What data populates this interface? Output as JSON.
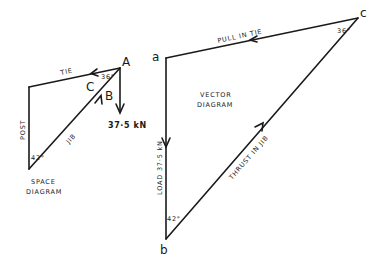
{
  "space_diagram": {
    "title_line1": "SPACE",
    "title_line2": "DIAGRAM",
    "members": {
      "tie": "TIE",
      "post": "POST",
      "jib": "JIB"
    },
    "node_label": "A",
    "region_labels": [
      "C",
      "B"
    ],
    "angles": {
      "at_A": "36°",
      "at_base": "42°"
    },
    "load": "37·5 kN"
  },
  "vector_diagram": {
    "title_line1": "VECTOR",
    "title_line2": "DIAGRAM",
    "vertices": [
      "a",
      "b",
      "c"
    ],
    "sides": {
      "ca": "PULL IN TIE",
      "ab": "LOAD  37·5 kN",
      "bc": "THRUST IN JIB"
    },
    "angles": {
      "at_c": "36°",
      "at_b": "42°"
    }
  }
}
